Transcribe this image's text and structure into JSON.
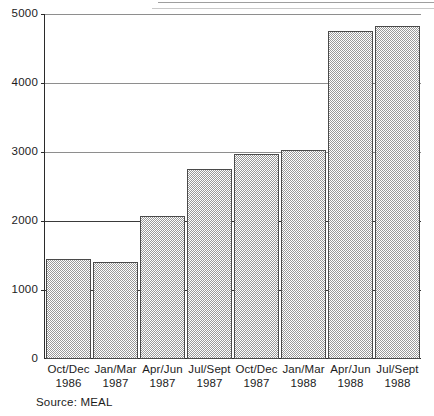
{
  "chart_data": {
    "type": "bar",
    "title": "",
    "subtitle": "",
    "xlabel": "",
    "ylabel": "",
    "ylim": [
      0,
      5000
    ],
    "grid": true,
    "legend": null,
    "source_note": "Source: MEAL",
    "y_ticks": [
      {
        "value": 5000,
        "label": "5000"
      },
      {
        "value": 4000,
        "label": "4000"
      },
      {
        "value": 3000,
        "label": "3000"
      },
      {
        "value": 2000,
        "label": "2000"
      },
      {
        "value": 1000,
        "label": "1000"
      },
      {
        "value": 0,
        "label": "0"
      }
    ],
    "categories": [
      "Oct/Dec 1986",
      "Jan/Mar 1987",
      "Apr/Jun 1987",
      "Jul/Sept 1987",
      "Oct/Dec 1987",
      "Jan/Mar 1988",
      "Apr/Jun 1988",
      "Jul/Sept 1988"
    ],
    "category_parts": [
      {
        "period": "Oct/Dec",
        "year": "1986"
      },
      {
        "period": "Jan/Mar",
        "year": "1987"
      },
      {
        "period": "Apr/Jun",
        "year": "1987"
      },
      {
        "period": "Jul/Sept",
        "year": "1987"
      },
      {
        "period": "Oct/Dec",
        "year": "1987"
      },
      {
        "period": "Jan/Mar",
        "year": "1988"
      },
      {
        "period": "Apr/Jun",
        "year": "1988"
      },
      {
        "period": "Jul/Sept",
        "year": "1988"
      }
    ],
    "values": [
      1450,
      1400,
      2070,
      2750,
      2970,
      3030,
      4760,
      4830
    ],
    "bar_fill": "#9a9a9a",
    "bar_edge": "#4a4a4a",
    "gridline_color": "#3a3a3a"
  }
}
